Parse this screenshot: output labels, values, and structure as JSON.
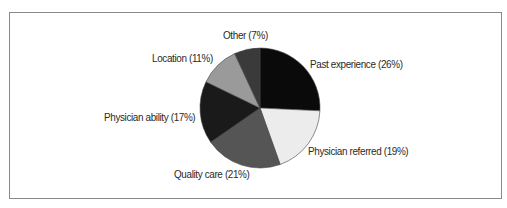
{
  "chart_data": {
    "type": "pie",
    "title": "",
    "start_angle_deg": 0,
    "direction": "clockwise",
    "center": [
      260,
      108
    ],
    "radius": 60,
    "slices": [
      {
        "label": "Past experience",
        "value": 26,
        "display": "Past experience (26%)",
        "color": "#0a0a0a",
        "label_pos": [
          310,
          58
        ]
      },
      {
        "label": "Physician referred",
        "value": 19,
        "display": "Physician referred (19%)",
        "color": "#ececec",
        "label_pos": [
          308,
          145
        ]
      },
      {
        "label": "Quality care",
        "value": 21,
        "display": "Quality care (21%)",
        "color": "#555555",
        "label_pos": [
          174,
          168
        ]
      },
      {
        "label": "Physician ability",
        "value": 17,
        "display": "Physician ability (17%)",
        "color": "#1a1a1a",
        "label_pos": [
          104,
          111
        ]
      },
      {
        "label": "Location",
        "value": 11,
        "display": "Location (11%)",
        "color": "#9a9a9a",
        "label_pos": [
          152,
          52
        ]
      },
      {
        "label": "Other",
        "value": 7,
        "display": "Other (7%)",
        "color": "#3a3a3a",
        "label_pos": [
          223,
          29
        ]
      }
    ],
    "legend": "none (direct labels)"
  }
}
